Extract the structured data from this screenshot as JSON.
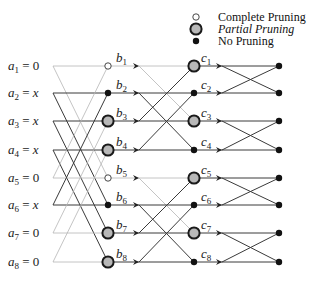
{
  "legend": {
    "items": [
      {
        "label": "Complete Pruning",
        "style": "hollow",
        "italic": false
      },
      {
        "label": "Partial Pruning",
        "style": "gray",
        "italic": true
      },
      {
        "label": "No Pruning",
        "style": "black",
        "italic": false
      }
    ]
  },
  "inputs": [
    {
      "name": "a",
      "sub": "1",
      "value": "0"
    },
    {
      "name": "a",
      "sub": "2",
      "value": "x"
    },
    {
      "name": "a",
      "sub": "3",
      "value": "x"
    },
    {
      "name": "a",
      "sub": "4",
      "value": "x"
    },
    {
      "name": "a",
      "sub": "5",
      "value": "0"
    },
    {
      "name": "a",
      "sub": "6",
      "value": "x"
    },
    {
      "name": "a",
      "sub": "7",
      "value": "0"
    },
    {
      "name": "a",
      "sub": "8",
      "value": "0"
    }
  ],
  "stage_b": [
    {
      "name": "b",
      "sub": "1",
      "node": "hollow"
    },
    {
      "name": "b",
      "sub": "2",
      "node": "black"
    },
    {
      "name": "b",
      "sub": "3",
      "node": "gray"
    },
    {
      "name": "b",
      "sub": "4",
      "node": "gray"
    },
    {
      "name": "b",
      "sub": "5",
      "node": "hollow"
    },
    {
      "name": "b",
      "sub": "6",
      "node": "black"
    },
    {
      "name": "b",
      "sub": "7",
      "node": "gray"
    },
    {
      "name": "b",
      "sub": "8",
      "node": "gray"
    }
  ],
  "stage_c": [
    {
      "name": "c",
      "sub": "1",
      "node": "gray"
    },
    {
      "name": "c",
      "sub": "2",
      "node": "black"
    },
    {
      "name": "c",
      "sub": "3",
      "node": "gray"
    },
    {
      "name": "c",
      "sub": "4",
      "node": "black"
    },
    {
      "name": "c",
      "sub": "5",
      "node": "gray"
    },
    {
      "name": "c",
      "sub": "6",
      "node": "black"
    },
    {
      "name": "c",
      "sub": "7",
      "node": "gray"
    },
    {
      "name": "c",
      "sub": "8",
      "node": "black"
    }
  ],
  "outputs": [
    {
      "node": "black"
    },
    {
      "node": "black"
    },
    {
      "node": "black"
    },
    {
      "node": "black"
    },
    {
      "node": "black"
    },
    {
      "node": "black"
    },
    {
      "node": "black"
    },
    {
      "node": "black"
    }
  ],
  "colors": {
    "zero_line": "#b5b5b5",
    "active_line": "#3a3a3a",
    "gray_fill": "#b8b8b8",
    "node_stroke": "#1a1a1a"
  }
}
